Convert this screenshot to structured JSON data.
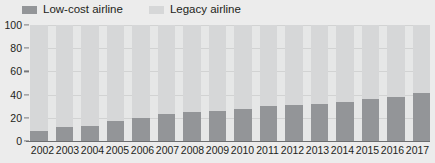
{
  "legend": {
    "items": [
      {
        "label": "Low-cost airline",
        "color": "#939598",
        "name": "legend-low-cost-airline"
      },
      {
        "label": "Legacy airline",
        "color": "#d6d7d8",
        "name": "legend-legacy-airline"
      }
    ]
  },
  "colors": {
    "low_cost": "#939598",
    "legacy": "#d6d7d8",
    "plot_background": "#e6e7e7",
    "page_background": "#ececec",
    "axis": "#6d6e70",
    "gridline": "#d2d3d3",
    "text": "#231f20"
  },
  "chart_data": {
    "type": "bar",
    "stacked": true,
    "title": "",
    "subtitle": "",
    "xlabel": "",
    "ylabel": "",
    "ylim": [
      0,
      100
    ],
    "yticks": [
      0,
      20,
      40,
      60,
      80,
      100
    ],
    "grid": true,
    "legend_position": "top-left",
    "categories": [
      "2002",
      "2003",
      "2004",
      "2005",
      "2006",
      "2007",
      "2008",
      "2009",
      "2010",
      "2011",
      "2012",
      "2013",
      "2014",
      "2015",
      "2016",
      "2017"
    ],
    "series": [
      {
        "name": "Low-cost airline",
        "color": "#939598",
        "values": [
          9,
          12,
          13,
          17,
          20,
          23,
          25,
          26,
          28,
          30,
          31,
          32,
          34,
          36,
          38,
          41
        ]
      },
      {
        "name": "Legacy airline",
        "color": "#d6d7d8",
        "values": [
          91,
          88,
          87,
          83,
          80,
          77,
          75,
          74,
          72,
          70,
          69,
          68,
          66,
          64,
          62,
          59
        ]
      }
    ]
  }
}
